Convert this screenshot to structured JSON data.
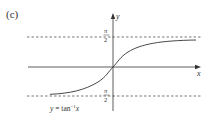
{
  "figure": {
    "panel_label": "(c)",
    "x_axis_label": "x",
    "y_axis_label": "y",
    "upper_asymptote": {
      "num": "π",
      "den": "2",
      "value": "π/2"
    },
    "lower_asymptote": {
      "num": "π",
      "den": "2",
      "value": "−π/2"
    },
    "curve_label": {
      "prefix": "y = tan",
      "sup": "−1",
      "suffix": "x"
    },
    "colors": {
      "line": "#333333",
      "dashed": "#555555",
      "background": "#ffffff"
    }
  }
}
